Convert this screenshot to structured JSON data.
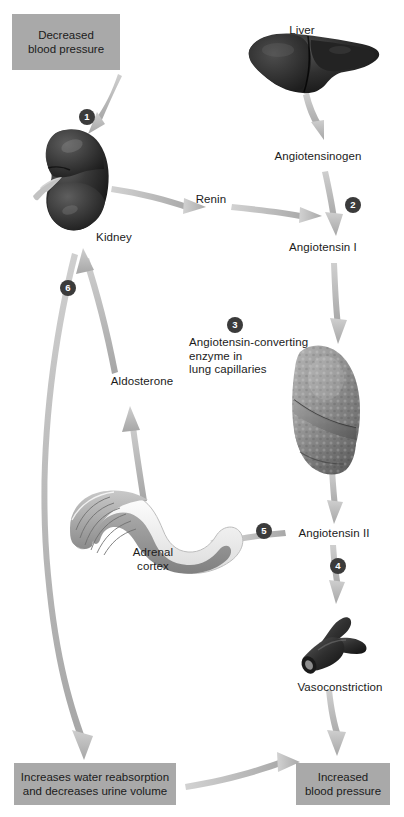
{
  "diagram": {
    "background_color": "#ffffff",
    "box_color": "#a9a9a9",
    "badge_color": "#3b3b3b",
    "arrow_color": "#b3b3b3",
    "text_color": "#1b1b1b"
  },
  "boxes": [
    {
      "id": "decreased-bp",
      "line1": "Decreased",
      "line2": "blood pressure"
    },
    {
      "id": "water-reabsorption",
      "line1": "Increases water reabsorption",
      "line2": "and decreases urine volume"
    },
    {
      "id": "increased-bp",
      "line1": "Increased",
      "line2": "blood pressure"
    }
  ],
  "labels": {
    "liver": "Liver",
    "kidney": "Kidney",
    "angiotensinogen": "Angiotensinogen",
    "renin": "Renin",
    "angiotensin_i": "Angiotensin I",
    "ace_line1": "Angiotensin-converting",
    "ace_line2": "enzyme in",
    "ace_line3": "lung capillaries",
    "angiotensin_ii": "Angiotensin II",
    "aldosterone": "Aldosterone",
    "adrenal_line1": "Adrenal",
    "adrenal_line2": "cortex",
    "vasoconstriction": "Vasoconstriction"
  },
  "badges": [
    {
      "n": "1",
      "at": "kidney-input"
    },
    {
      "n": "2",
      "at": "angiotensinogen-to-angiotensin-i"
    },
    {
      "n": "3",
      "at": "ace-lung"
    },
    {
      "n": "4",
      "at": "angiotensin-ii-to-vasoconstriction"
    },
    {
      "n": "5",
      "at": "angiotensin-ii-to-adrenal"
    },
    {
      "n": "6",
      "at": "aldosterone-to-kidney"
    }
  ],
  "organs": [
    {
      "id": "liver",
      "name": "liver-illustration"
    },
    {
      "id": "kidney",
      "name": "kidney-illustration"
    },
    {
      "id": "lung",
      "name": "lung-illustration"
    },
    {
      "id": "adrenal",
      "name": "adrenal-gland-illustration"
    },
    {
      "id": "vessel",
      "name": "blood-vessel-illustration"
    }
  ]
}
